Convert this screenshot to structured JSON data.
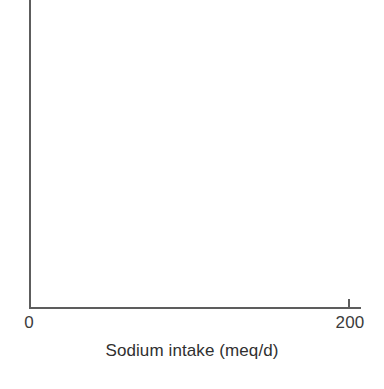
{
  "chart_data": {
    "type": "line",
    "title": "",
    "subtitle": "",
    "xlabel": "Sodium intake (meq/d)",
    "ylabel": "",
    "xlim": [
      0,
      200
    ],
    "x_tick_labels": [
      "0",
      "200"
    ],
    "x_tick_values": [
      0,
      200
    ],
    "y_tick_labels": [],
    "y_tick_values": [],
    "grid": false,
    "legend": null,
    "series": [],
    "annotations": []
  },
  "figure": {
    "x_axis": {
      "title": "Sodium intake (meq/d)",
      "tick_zero_label": "0",
      "tick_max_label": "200"
    },
    "colors": {
      "axis_line": "#5d5d5d",
      "tick_label_text": "#3b3b3b",
      "axis_title_text": "#303030",
      "background": "#ffffff"
    }
  }
}
